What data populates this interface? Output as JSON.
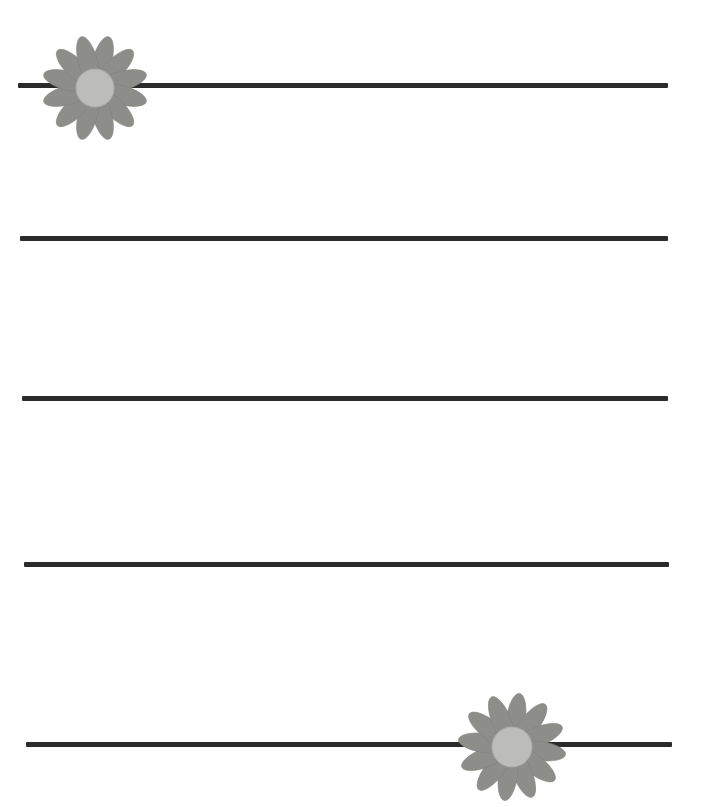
{
  "page": {
    "kind": "decorative-lined-writing-paper",
    "width": 705,
    "height": 807,
    "background_color": "#ffffff",
    "title": "",
    "body_text": ""
  },
  "colors": {
    "background": "#ffffff",
    "rule_line": "#2b2b2b",
    "flower_petal": "#8d8d8a",
    "flower_petal_edge": "#828280",
    "flower_center": "#bcbcb8",
    "flower_center_edge": "#adada9"
  },
  "rules": {
    "count": 5,
    "thickness": 5,
    "color": "#2b2b2b",
    "lines": [
      {
        "id": "rule-line-1",
        "y": 83,
        "x": 18,
        "width": 650,
        "label": ""
      },
      {
        "id": "rule-line-2",
        "y": 236,
        "x": 20,
        "width": 648,
        "label": ""
      },
      {
        "id": "rule-line-3",
        "y": 396,
        "x": 22,
        "width": 646,
        "label": ""
      },
      {
        "id": "rule-line-4",
        "y": 562,
        "x": 24,
        "width": 645,
        "label": ""
      },
      {
        "id": "rule-line-5",
        "y": 742,
        "x": 26,
        "width": 646,
        "label": ""
      }
    ]
  },
  "flowers": [
    {
      "id": "flower-top-left",
      "name": "daisy-top-left",
      "center_x": 95,
      "center_y": 88,
      "radius": 60,
      "petal_count": 12,
      "petal_length": 52,
      "petal_width": 19,
      "center_radius": 19,
      "rotation_deg": 15,
      "on_rule_line": 1
    },
    {
      "id": "flower-bottom-right",
      "name": "daisy-bottom-right",
      "center_x": 512,
      "center_y": 747,
      "radius": 60,
      "petal_count": 12,
      "petal_length": 53,
      "petal_width": 19,
      "center_radius": 20,
      "rotation_deg": 8,
      "on_rule_line": 5
    }
  ]
}
